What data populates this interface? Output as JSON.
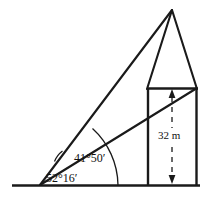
{
  "figure": {
    "kind": "geometry-diagram",
    "stroke_color": "#1a1a1a",
    "background_color": "#ffffff",
    "labels": {
      "angle_low": "52°16′",
      "angle_high": "41°50′",
      "height": "32 m"
    },
    "annotations": {
      "dimension_arrow": "double-headed-dashed-vertical-arrow",
      "arc_inner": "angle-arc-52-16",
      "arc_outer": "angle-arc-41-50"
    },
    "geometry": {
      "observer_point": [
        40,
        185
      ],
      "ground_line": [
        [
          12,
          185
        ],
        [
          200,
          185
        ]
      ],
      "wall_left": [
        [
          147,
          88
        ],
        [
          147,
          185
        ]
      ],
      "wall_right": [
        [
          197,
          88
        ],
        [
          197,
          185
        ]
      ],
      "roof_top": [
        [
          147,
          88
        ],
        [
          197,
          88
        ]
      ],
      "roof_apex": [
        172,
        10
      ],
      "sight_line_to_apex": [
        [
          40,
          185
        ],
        [
          172,
          10
        ]
      ],
      "sight_line_to_eave": [
        [
          40,
          185
        ],
        [
          197,
          88
        ]
      ],
      "height_dimension": [
        [
          172,
          91
        ],
        [
          172,
          183
        ]
      ]
    }
  }
}
